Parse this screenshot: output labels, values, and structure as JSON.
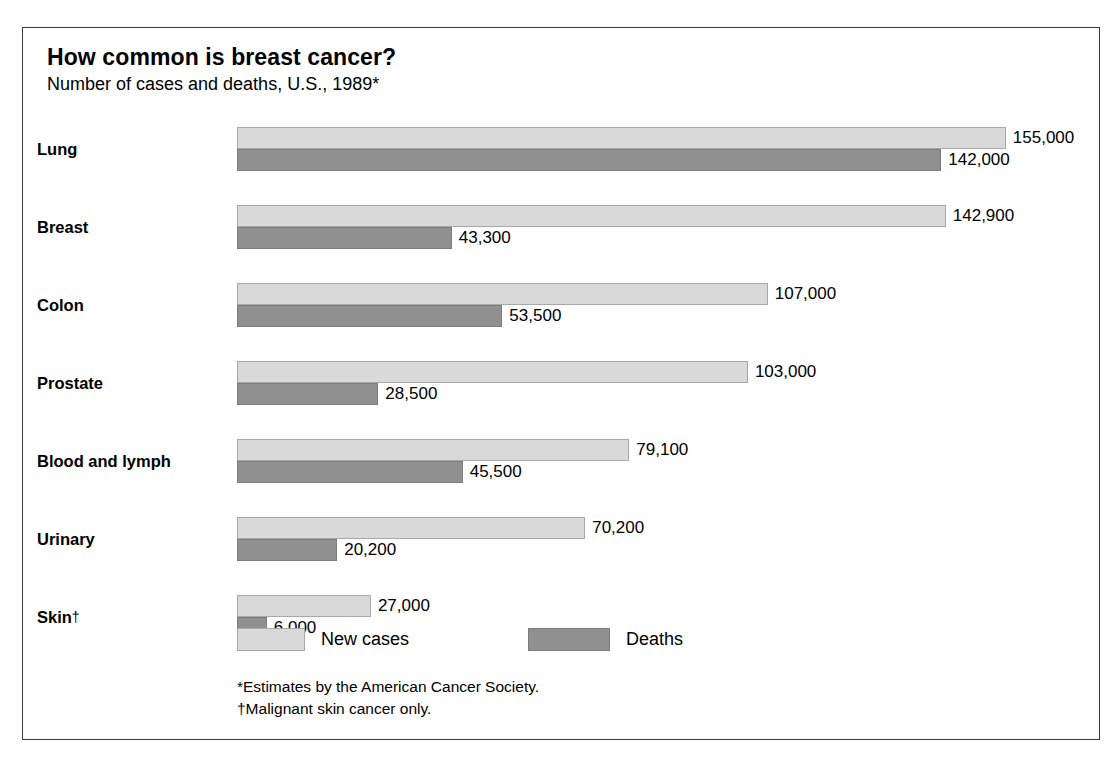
{
  "header": {
    "title": "How common is breast cancer?",
    "subtitle": "Number of cases and deaths, U.S., 1989*"
  },
  "legend": {
    "cases_label": "New cases",
    "deaths_label": "Deaths"
  },
  "footnotes": {
    "estimates": "*Estimates by the American Cancer Society.",
    "skin": "†Malignant skin cancer only."
  },
  "colors": {
    "new_cases": "#d9d9d9",
    "deaths": "#909090",
    "frame": "#3a3a3a",
    "text": "#000000"
  },
  "rows": [
    {
      "label": "Lung",
      "dagger": "",
      "cases_value": 155000,
      "deaths_value": 142000,
      "cases_text": "155,000",
      "deaths_text": "142,000"
    },
    {
      "label": "Breast",
      "dagger": "",
      "cases_value": 142900,
      "deaths_value": 43300,
      "cases_text": "142,900",
      "deaths_text": "43,300"
    },
    {
      "label": "Colon",
      "dagger": "",
      "cases_value": 107000,
      "deaths_value": 53500,
      "cases_text": "107,000",
      "deaths_text": "53,500"
    },
    {
      "label": "Prostate",
      "dagger": "",
      "cases_value": 103000,
      "deaths_value": 28500,
      "cases_text": "103,000",
      "deaths_text": "28,500"
    },
    {
      "label": "Blood and lymph",
      "dagger": "",
      "cases_value": 79100,
      "deaths_value": 45500,
      "cases_text": "79,100",
      "deaths_text": "45,500"
    },
    {
      "label": "Urinary",
      "dagger": "",
      "cases_value": 70200,
      "deaths_value": 20200,
      "cases_text": "70,200",
      "deaths_text": "20,200"
    },
    {
      "label": "Skin",
      "dagger": "†",
      "cases_value": 27000,
      "deaths_value": 6000,
      "cases_text": "27,000",
      "deaths_text": "6,000"
    }
  ],
  "chart_data": {
    "type": "bar",
    "title": "How common is breast cancer?",
    "subtitle": "Number of cases and deaths, U.S., 1989*",
    "orientation": "horizontal",
    "xlabel": "",
    "ylabel": "",
    "xlim": [
      0,
      155000
    ],
    "grid": false,
    "legend_position": "bottom",
    "categories": [
      "Lung",
      "Breast",
      "Colon",
      "Prostate",
      "Blood and lymph",
      "Urinary",
      "Skin†"
    ],
    "series": [
      {
        "name": "New cases",
        "color": "#d9d9d9",
        "values": [
          155000,
          142900,
          107000,
          103000,
          79100,
          70200,
          27000
        ]
      },
      {
        "name": "Deaths",
        "color": "#909090",
        "values": [
          142000,
          43300,
          53500,
          28500,
          45500,
          20200,
          6000
        ]
      }
    ],
    "data_labels": {
      "New cases": [
        "155,000",
        "142,900",
        "107,000",
        "103,000",
        "79,100",
        "70,200",
        "27,000"
      ],
      "Deaths": [
        "142,000",
        "43,300",
        "53,500",
        "28,500",
        "45,500",
        "20,200",
        "6,000"
      ]
    },
    "annotations": [
      "*Estimates by the American Cancer Society.",
      "†Malignant skin cancer only."
    ]
  },
  "render": {
    "bar_origin_px": 214,
    "px_per_unit": 0.00496,
    "row_pitch_px": 78,
    "row_top_px": 99
  }
}
